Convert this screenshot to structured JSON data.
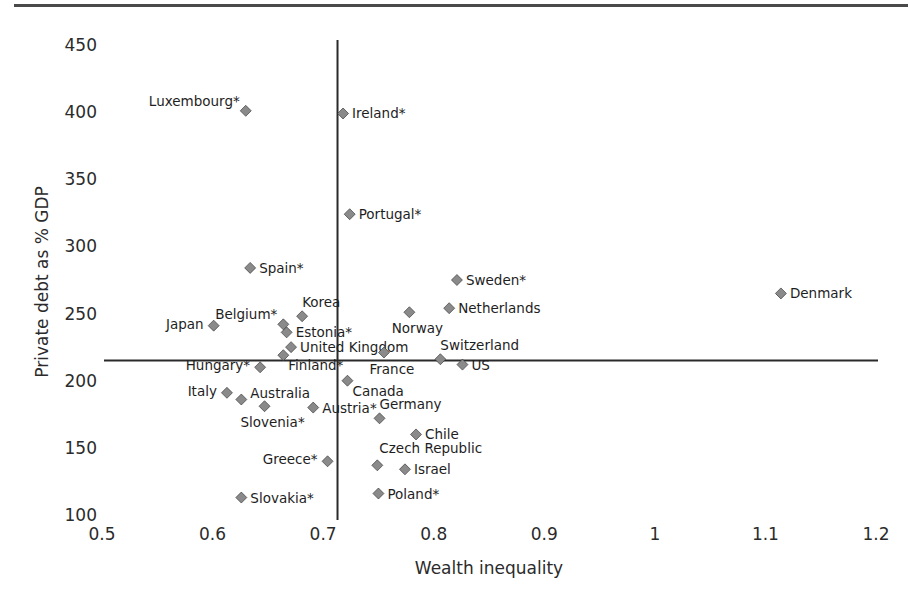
{
  "chart_data": {
    "type": "scatter",
    "title": "",
    "xlabel": "Wealth inequality",
    "ylabel": "Private debt as % GDP",
    "xlim": [
      0.5,
      1.2
    ],
    "ylim": [
      100,
      450
    ],
    "x_ticks": [
      "0.5",
      "0.6",
      "0.7",
      "0.8",
      "0.9",
      "1",
      "1.1",
      "1.2"
    ],
    "x_tick_values": [
      0.5,
      0.6,
      0.7,
      0.8,
      0.9,
      1.0,
      1.1,
      1.2
    ],
    "y_ticks": [
      "100",
      "150",
      "200",
      "250",
      "300",
      "350",
      "400",
      "450"
    ],
    "y_tick_values": [
      100,
      150,
      200,
      250,
      300,
      350,
      400,
      450
    ],
    "grid": false,
    "legend": null,
    "reference_lines": {
      "vertical_x": 0.713,
      "horizontal_y": 215
    },
    "marker": {
      "shape": "diamond",
      "color": "#8a8a8a",
      "edge": "#2a2a2a"
    },
    "points": [
      {
        "label": "Luxembourg*",
        "x": 0.63,
        "y": 401,
        "lpos": "left-up"
      },
      {
        "label": "Ireland*",
        "x": 0.718,
        "y": 399,
        "lpos": "right"
      },
      {
        "label": "Portugal*",
        "x": 0.724,
        "y": 324,
        "lpos": "right"
      },
      {
        "label": "Spain*",
        "x": 0.634,
        "y": 284,
        "lpos": "right"
      },
      {
        "label": "Sweden*",
        "x": 0.821,
        "y": 275,
        "lpos": "right"
      },
      {
        "label": "Netherlands",
        "x": 0.814,
        "y": 254,
        "lpos": "right"
      },
      {
        "label": "Norway",
        "x": 0.778,
        "y": 251,
        "lpos": "below"
      },
      {
        "label": "Denmark",
        "x": 1.114,
        "y": 265,
        "lpos": "right"
      },
      {
        "label": "Japan",
        "x": 0.601,
        "y": 241,
        "lpos": "left"
      },
      {
        "label": "Belgium*",
        "x": 0.664,
        "y": 242,
        "lpos": "left-up"
      },
      {
        "label": "Korea",
        "x": 0.681,
        "y": 248,
        "lpos": "right-up"
      },
      {
        "label": "Estonia*",
        "x": 0.667,
        "y": 236,
        "lpos": "right"
      },
      {
        "label": "United Kingdom",
        "x": 0.671,
        "y": 225,
        "lpos": "right"
      },
      {
        "label": "Finland*",
        "x": 0.664,
        "y": 219,
        "lpos": "right-down"
      },
      {
        "label": "Hungary*",
        "x": 0.643,
        "y": 210,
        "lpos": "left"
      },
      {
        "label": "France",
        "x": 0.755,
        "y": 221,
        "lpos": "below"
      },
      {
        "label": "Switzerland",
        "x": 0.806,
        "y": 216,
        "lpos": "right-up"
      },
      {
        "label": "US",
        "x": 0.826,
        "y": 212,
        "lpos": "right"
      },
      {
        "label": "Canada",
        "x": 0.722,
        "y": 200,
        "lpos": "right-down"
      },
      {
        "label": "Italy",
        "x": 0.613,
        "y": 191,
        "lpos": "left"
      },
      {
        "label": "Australia",
        "x": 0.626,
        "y": 186,
        "lpos": "right-up2"
      },
      {
        "label": "Slovenia*",
        "x": 0.647,
        "y": 181,
        "lpos": "below"
      },
      {
        "label": "Austria*",
        "x": 0.691,
        "y": 180,
        "lpos": "right"
      },
      {
        "label": "Germany",
        "x": 0.751,
        "y": 172,
        "lpos": "right-up"
      },
      {
        "label": "Chile",
        "x": 0.784,
        "y": 160,
        "lpos": "right"
      },
      {
        "label": "Czech Republic",
        "x": 0.749,
        "y": 137,
        "lpos": "above"
      },
      {
        "label": "Israel",
        "x": 0.774,
        "y": 134,
        "lpos": "right"
      },
      {
        "label": "Poland*",
        "x": 0.75,
        "y": 116,
        "lpos": "right"
      },
      {
        "label": "Greece*",
        "x": 0.704,
        "y": 140,
        "lpos": "left"
      },
      {
        "label": "Slovakia*",
        "x": 0.626,
        "y": 113,
        "lpos": "right"
      }
    ]
  }
}
